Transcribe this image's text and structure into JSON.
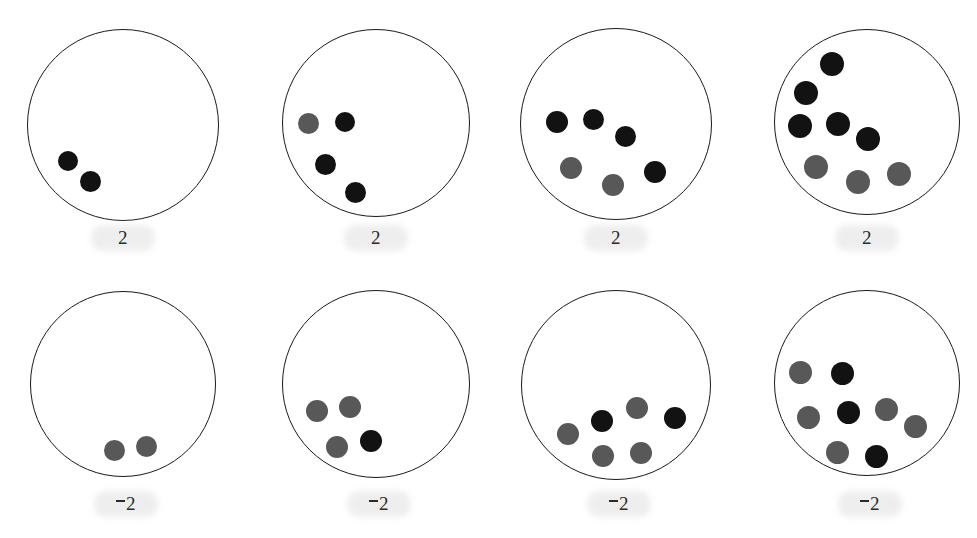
{
  "figure": {
    "width": 977,
    "height": 538,
    "background": "#ffffff",
    "colors": {
      "black_dot": "#121212",
      "gray_dot": "#585858",
      "circle_outline": "#1a1a1a",
      "label_text": "#2b2b2b",
      "label_smudge": "#eeeeee"
    },
    "rows": 2,
    "columns": 4
  },
  "chart_data": {
    "type": "scatter",
    "title": "",
    "xlabel": "",
    "ylabel": "",
    "panels": [
      {
        "id": "panel-r1c1",
        "row": 1,
        "column": 1,
        "label": "2",
        "label_sign": "positive",
        "dot_count": 2,
        "black_count": 2,
        "gray_count": 0,
        "dots": [
          {
            "color": "black",
            "cx": 68,
            "cy": 161,
            "r": 10
          },
          {
            "color": "black",
            "cx": 90,
            "cy": 181,
            "r": 10.5
          }
        ]
      },
      {
        "id": "panel-r1c2",
        "row": 1,
        "column": 2,
        "label": "2",
        "label_sign": "positive",
        "dot_count": 4,
        "black_count": 3,
        "gray_count": 1,
        "dots": [
          {
            "color": "gray",
            "cx": 308,
            "cy": 123,
            "r": 10.5
          },
          {
            "color": "black",
            "cx": 345,
            "cy": 122,
            "r": 10
          },
          {
            "color": "black",
            "cx": 325,
            "cy": 164,
            "r": 10.5
          },
          {
            "color": "black",
            "cx": 355,
            "cy": 192,
            "r": 10.5
          }
        ]
      },
      {
        "id": "panel-r1c3",
        "row": 1,
        "column": 3,
        "label": "2",
        "label_sign": "positive",
        "dot_count": 6,
        "black_count": 4,
        "gray_count": 2,
        "dots": [
          {
            "color": "black",
            "cx": 557,
            "cy": 122,
            "r": 11
          },
          {
            "color": "black",
            "cx": 593,
            "cy": 119,
            "r": 10.5
          },
          {
            "color": "black",
            "cx": 625,
            "cy": 136,
            "r": 10.5
          },
          {
            "color": "gray",
            "cx": 571,
            "cy": 168,
            "r": 11
          },
          {
            "color": "gray",
            "cx": 613,
            "cy": 185,
            "r": 11
          },
          {
            "color": "black",
            "cx": 655,
            "cy": 172,
            "r": 11
          }
        ]
      },
      {
        "id": "panel-r1c4",
        "row": 1,
        "column": 4,
        "label": "2",
        "label_sign": "positive",
        "dot_count": 8,
        "black_count": 5,
        "gray_count": 3,
        "dots": [
          {
            "color": "black",
            "cx": 832,
            "cy": 64,
            "r": 12
          },
          {
            "color": "black",
            "cx": 806,
            "cy": 93,
            "r": 12
          },
          {
            "color": "black",
            "cx": 800,
            "cy": 126,
            "r": 12
          },
          {
            "color": "black",
            "cx": 838,
            "cy": 124,
            "r": 12
          },
          {
            "color": "black",
            "cx": 868,
            "cy": 139,
            "r": 12
          },
          {
            "color": "gray",
            "cx": 816,
            "cy": 167,
            "r": 12
          },
          {
            "color": "gray",
            "cx": 858,
            "cy": 182,
            "r": 12
          },
          {
            "color": "gray",
            "cx": 899,
            "cy": 174,
            "r": 12
          }
        ]
      },
      {
        "id": "panel-r2c1",
        "row": 2,
        "column": 1,
        "label": "2",
        "label_sign": "negative",
        "dot_count": 2,
        "black_count": 0,
        "gray_count": 2,
        "dots": [
          {
            "color": "gray",
            "cx": 114,
            "cy": 450,
            "r": 10.5
          },
          {
            "color": "gray",
            "cx": 146,
            "cy": 446,
            "r": 10.5
          }
        ]
      },
      {
        "id": "panel-r2c2",
        "row": 2,
        "column": 2,
        "label": "2",
        "label_sign": "negative",
        "dot_count": 4,
        "black_count": 1,
        "gray_count": 3,
        "dots": [
          {
            "color": "gray",
            "cx": 317,
            "cy": 411,
            "r": 11
          },
          {
            "color": "gray",
            "cx": 350,
            "cy": 407,
            "r": 11
          },
          {
            "color": "gray",
            "cx": 337,
            "cy": 447,
            "r": 11
          },
          {
            "color": "black",
            "cx": 371,
            "cy": 441,
            "r": 11
          }
        ]
      },
      {
        "id": "panel-r2c3",
        "row": 2,
        "column": 3,
        "label": "2",
        "label_sign": "negative",
        "dot_count": 6,
        "black_count": 2,
        "gray_count": 4,
        "dots": [
          {
            "color": "gray",
            "cx": 568,
            "cy": 434,
            "r": 11
          },
          {
            "color": "black",
            "cx": 602,
            "cy": 421,
            "r": 11
          },
          {
            "color": "gray",
            "cx": 637,
            "cy": 408,
            "r": 11
          },
          {
            "color": "black",
            "cx": 675,
            "cy": 418,
            "r": 11
          },
          {
            "color": "gray",
            "cx": 603,
            "cy": 456,
            "r": 11
          },
          {
            "color": "gray",
            "cx": 641,
            "cy": 453,
            "r": 11
          }
        ]
      },
      {
        "id": "panel-r2c4",
        "row": 2,
        "column": 4,
        "label": "2",
        "label_sign": "negative",
        "dot_count": 8,
        "black_count": 3,
        "gray_count": 5,
        "dots": [
          {
            "color": "gray",
            "cx": 800,
            "cy": 372,
            "r": 11.5
          },
          {
            "color": "black",
            "cx": 842,
            "cy": 373,
            "r": 11.5
          },
          {
            "color": "gray",
            "cx": 808,
            "cy": 417,
            "r": 11.5
          },
          {
            "color": "black",
            "cx": 848,
            "cy": 412,
            "r": 11.5
          },
          {
            "color": "gray",
            "cx": 886,
            "cy": 409,
            "r": 11.5
          },
          {
            "color": "gray",
            "cx": 915,
            "cy": 426,
            "r": 11.5
          },
          {
            "color": "gray",
            "cx": 837,
            "cy": 452,
            "r": 11.5
          },
          {
            "color": "black",
            "cx": 876,
            "cy": 456,
            "r": 11.5
          }
        ]
      }
    ],
    "circles": [
      {
        "id": "circle-r1c1",
        "cx": 123,
        "cy": 125,
        "r": 96
      },
      {
        "id": "circle-r1c2",
        "cx": 376,
        "cy": 123,
        "r": 94
      },
      {
        "id": "circle-r1c3",
        "cx": 616,
        "cy": 124,
        "r": 96
      },
      {
        "id": "circle-r1c4",
        "cx": 867,
        "cy": 122,
        "r": 93
      }
    ],
    "circles_bottom": [
      {
        "id": "circle-r2c1",
        "cx": 123,
        "cy": 384,
        "r": 93
      },
      {
        "id": "circle-r2c2",
        "cx": 376,
        "cy": 384,
        "r": 94
      },
      {
        "id": "circle-r2c3",
        "cx": 616,
        "cy": 385,
        "r": 95
      },
      {
        "id": "circle-r2c4",
        "cx": 867,
        "cy": 383,
        "r": 93
      }
    ],
    "labels": [
      {
        "id": "label-r1c1",
        "text": "2",
        "sign": "positive",
        "cx": 123,
        "cy": 240
      },
      {
        "id": "label-r1c2",
        "text": "2",
        "sign": "positive",
        "cx": 376,
        "cy": 240
      },
      {
        "id": "label-r1c3",
        "text": "2",
        "sign": "positive",
        "cx": 616,
        "cy": 240
      },
      {
        "id": "label-r1c4",
        "text": "2",
        "sign": "positive",
        "cx": 867,
        "cy": 240
      },
      {
        "id": "label-r2c1",
        "text": "2",
        "sign": "negative",
        "cx": 126,
        "cy": 506
      },
      {
        "id": "label-r2c2",
        "text": "2",
        "sign": "negative",
        "cx": 379,
        "cy": 506
      },
      {
        "id": "label-r2c3",
        "text": "2",
        "sign": "negative",
        "cx": 619,
        "cy": 506
      },
      {
        "id": "label-r2c4",
        "text": "2",
        "sign": "negative",
        "cx": 870,
        "cy": 506
      }
    ]
  }
}
